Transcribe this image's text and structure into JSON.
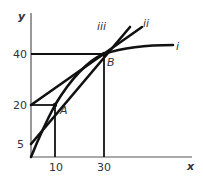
{
  "diagram": {
    "axes": {
      "x_label": "x",
      "y_label": "y",
      "x_ticks": [
        "10",
        "30"
      ],
      "y_ticks": [
        "40",
        "20",
        "5"
      ]
    },
    "points": {
      "A": "A",
      "B": "B"
    },
    "curves": {
      "i": "i",
      "ii": "ii",
      "iii": "iii"
    },
    "colors": {
      "line": "#111111",
      "text": "#333333"
    }
  }
}
